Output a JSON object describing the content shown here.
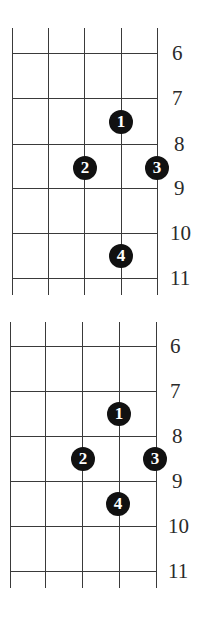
{
  "diagrams": [
    {
      "name": "fingering-diagram-1",
      "top": 28,
      "bottom": 295,
      "strings_x": [
        12,
        48,
        84,
        121,
        157
      ],
      "frets": [
        {
          "label": "6",
          "y": 53
        },
        {
          "label": "7",
          "y": 98
        },
        {
          "label": "8",
          "y": 144
        },
        {
          "label": "9",
          "y": 188
        },
        {
          "label": "10",
          "y": 233
        },
        {
          "label": "11",
          "y": 278
        }
      ],
      "label_x": 170,
      "dots": [
        {
          "finger": "1",
          "x": 121,
          "y": 122
        },
        {
          "finger": "2",
          "x": 85,
          "y": 168
        },
        {
          "finger": "3",
          "x": 157,
          "y": 168
        },
        {
          "finger": "4",
          "x": 121,
          "y": 256
        }
      ]
    },
    {
      "name": "fingering-diagram-2",
      "top": 322,
      "bottom": 588,
      "strings_x": [
        10,
        45,
        82,
        119,
        156
      ],
      "frets": [
        {
          "label": "6",
          "y": 346
        },
        {
          "label": "7",
          "y": 391
        },
        {
          "label": "8",
          "y": 436
        },
        {
          "label": "9",
          "y": 481
        },
        {
          "label": "10",
          "y": 526
        },
        {
          "label": "11",
          "y": 571
        }
      ],
      "label_x": 168,
      "dots": [
        {
          "finger": "1",
          "x": 119,
          "y": 414
        },
        {
          "finger": "2",
          "x": 83,
          "y": 459
        },
        {
          "finger": "3",
          "x": 155,
          "y": 459
        },
        {
          "finger": "4",
          "x": 118,
          "y": 504
        }
      ]
    }
  ],
  "label_offsets": {
    "6": 2,
    "7": 2,
    "8": 4,
    "9": 4,
    "10": 0,
    "11": 0
  }
}
